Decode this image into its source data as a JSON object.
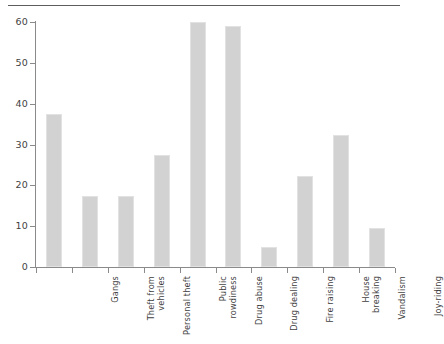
{
  "chart_data": {
    "type": "bar",
    "title": "",
    "xlabel": "",
    "ylabel": "",
    "categories": [
      "Gangs",
      "Theft from vehicles",
      "Personal theft",
      "Public rowdiness",
      "Drug abuse",
      "Drug dealing",
      "Fire raising",
      "House breaking",
      "Vandalism",
      "Joy-riding"
    ],
    "values": [
      37.5,
      17.4,
      17.4,
      27.5,
      60,
      59,
      5,
      22.3,
      32.4,
      9.6
    ],
    "ylim": [
      0,
      60
    ],
    "yticks": [
      0,
      10,
      20,
      30,
      40,
      50,
      60
    ],
    "ytick_labels": [
      "0",
      "10",
      "20",
      "30",
      "40",
      "50",
      "60"
    ],
    "grid": false,
    "legend": "none",
    "bar_color": "#d2d2d2",
    "axis_color": "#8a8a8a"
  },
  "axis": {
    "y_labels": [
      "60",
      "50",
      "40",
      "30",
      "20",
      "10",
      "0"
    ]
  },
  "categories": {
    "c0": "Gangs",
    "c1": "Theft from\nvehicles",
    "c2": "Personal theft",
    "c3": "Public\nrowdiness",
    "c4": "Drug abuse",
    "c5": "Drug dealing",
    "c6": "Fire raising",
    "c7": "House\nbreaking",
    "c8": "Vandalism",
    "c9": "Joy-riding"
  }
}
